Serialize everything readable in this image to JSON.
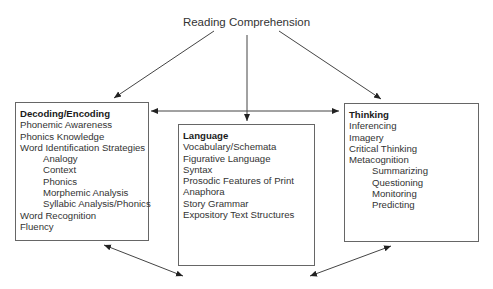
{
  "title": "Reading Comprehension",
  "boxes": {
    "decoding": {
      "heading": "Decoding/Encoding",
      "items": [
        {
          "label": "Phonemic Awareness",
          "level": 0
        },
        {
          "label": "Phonics Knowledge",
          "level": 0
        },
        {
          "label": "Word Identification Strategies",
          "level": 0
        },
        {
          "label": "Analogy",
          "level": 1
        },
        {
          "label": "Context",
          "level": 1
        },
        {
          "label": "Phonics",
          "level": 1
        },
        {
          "label": "Morphemic Analysis",
          "level": 1
        },
        {
          "label": "Syllabic Analysis/Phonics",
          "level": 1
        },
        {
          "label": "Word Recognition",
          "level": 0
        },
        {
          "label": "Fluency",
          "level": 0
        }
      ]
    },
    "language": {
      "heading": "Language",
      "items": [
        {
          "label": "Vocabulary/Schemata",
          "level": 0
        },
        {
          "label": "Figurative Language",
          "level": 0
        },
        {
          "label": "Syntax",
          "level": 0
        },
        {
          "label": "Prosodic Features of Print",
          "level": 0
        },
        {
          "label": "Anaphora",
          "level": 0
        },
        {
          "label": "Story Grammar",
          "level": 0
        },
        {
          "label": "Expository Text Structures",
          "level": 0
        }
      ]
    },
    "thinking": {
      "heading": "Thinking",
      "items": [
        {
          "label": "Inferencing",
          "level": 0
        },
        {
          "label": "Imagery",
          "level": 0
        },
        {
          "label": "Critical Thinking",
          "level": 0
        },
        {
          "label": "Metacognition",
          "level": 0
        },
        {
          "label": "Summarizing",
          "level": 1
        },
        {
          "label": "Questioning",
          "level": 1
        },
        {
          "label": "Monitoring",
          "level": 1
        },
        {
          "label": "Predicting",
          "level": 1
        }
      ]
    }
  },
  "colors": {
    "line": "#333333",
    "border": "#666666"
  }
}
